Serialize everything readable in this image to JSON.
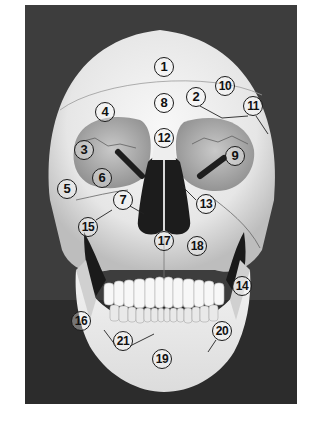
{
  "figure": {
    "background_color": "#3d3d3d",
    "bone_color": "#ededed",
    "label_border_color": "#1a1a1a"
  },
  "labels": [
    {
      "n": "1",
      "x": 164,
      "y": 67
    },
    {
      "n": "2",
      "x": 196,
      "y": 97
    },
    {
      "n": "3",
      "x": 84,
      "y": 150
    },
    {
      "n": "4",
      "x": 105,
      "y": 112
    },
    {
      "n": "5",
      "x": 67,
      "y": 189
    },
    {
      "n": "6",
      "x": 102,
      "y": 178
    },
    {
      "n": "7",
      "x": 123,
      "y": 200
    },
    {
      "n": "8",
      "x": 164,
      "y": 103
    },
    {
      "n": "9",
      "x": 235,
      "y": 156
    },
    {
      "n": "10",
      "x": 225,
      "y": 86
    },
    {
      "n": "11",
      "x": 253,
      "y": 106
    },
    {
      "n": "12",
      "x": 164,
      "y": 138
    },
    {
      "n": "13",
      "x": 206,
      "y": 204
    },
    {
      "n": "14",
      "x": 242,
      "y": 286
    },
    {
      "n": "15",
      "x": 88,
      "y": 227
    },
    {
      "n": "16",
      "x": 81,
      "y": 321
    },
    {
      "n": "17",
      "x": 164,
      "y": 241
    },
    {
      "n": "18",
      "x": 197,
      "y": 246
    },
    {
      "n": "19",
      "x": 162,
      "y": 359
    },
    {
      "n": "20",
      "x": 222,
      "y": 331
    },
    {
      "n": "21",
      "x": 123,
      "y": 341
    }
  ]
}
